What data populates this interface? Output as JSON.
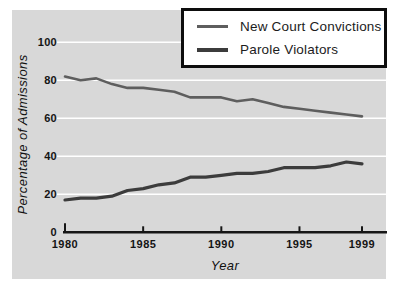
{
  "chart_data": {
    "type": "line",
    "title": "",
    "xlabel": "Year",
    "ylabel": "Percentage of Admissions",
    "x": [
      1980,
      1981,
      1982,
      1983,
      1984,
      1985,
      1986,
      1987,
      1988,
      1989,
      1990,
      1991,
      1992,
      1993,
      1994,
      1995,
      1996,
      1997,
      1998,
      1999
    ],
    "series": [
      {
        "name": "New Court Convictions",
        "color": "#5e5e5e",
        "stroke_width": 2.6,
        "values": [
          82,
          80,
          81,
          78,
          76,
          76,
          75,
          74,
          71,
          71,
          71,
          69,
          70,
          68,
          66,
          65,
          64,
          63,
          62,
          61
        ]
      },
      {
        "name": "Parole Violators",
        "color": "#3c3c3c",
        "stroke_width": 3.2,
        "values": [
          17,
          18,
          18,
          19,
          22,
          23,
          25,
          26,
          29,
          29,
          30,
          31,
          31,
          32,
          34,
          34,
          34,
          35,
          37,
          36
        ]
      }
    ],
    "ylim": [
      0,
      100
    ],
    "yticks": [
      0,
      20,
      40,
      60,
      80,
      100
    ],
    "xticks": [
      1980,
      1985,
      1990,
      1995,
      1999
    ],
    "grid": true,
    "legend_position": "top-right"
  },
  "colors": {
    "panel_bg": "#d8d8d8",
    "gridline": "#ffffff",
    "axis": "#161616",
    "legend_bg": "#ffffff",
    "legend_border": "#0d0d0d"
  }
}
